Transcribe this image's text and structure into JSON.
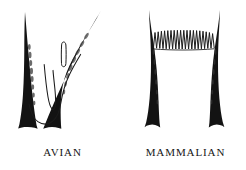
{
  "figure": {
    "background_color": "#ffffff",
    "ink_color": "#111111",
    "width": 246,
    "height": 170,
    "caption_font_style": "serif-small-caps-allcaps"
  },
  "panels": [
    {
      "id": "avian",
      "label": "AVIAN",
      "description": "Ink brush drawing of two tapered wedge strokes flanking a thin sagging line with a narrow central V hook and a small detached sliver oval",
      "strokes": [
        {
          "name": "left-wedge",
          "type": "tapered-wedge",
          "thin_end": "top",
          "thick_end": "bottom"
        },
        {
          "name": "right-wedge",
          "type": "tapered-wedge-curved",
          "thin_end": "top",
          "thick_end": "bottom"
        },
        {
          "name": "sagging-connector",
          "type": "thin-curve"
        },
        {
          "name": "central-v-hook",
          "type": "thin-v-hook"
        },
        {
          "name": "sliver-oval",
          "type": "small-outline-oval"
        }
      ]
    },
    {
      "id": "mammalian",
      "label": "MAMMALIAN",
      "description": "Ink brush drawing of two tapered columns flaring at the base joined at the top by a dense accordion zigzag band",
      "zigzag_peak_count": 19,
      "strokes": [
        {
          "name": "left-column",
          "type": "tapered-column",
          "thin_end": "top",
          "thick_end": "bottom",
          "base": "flared"
        },
        {
          "name": "right-column",
          "type": "tapered-column",
          "thin_end": "top",
          "thick_end": "bottom",
          "base": "flared"
        },
        {
          "name": "accordion-zigzag",
          "type": "dense-zigzag-band"
        }
      ]
    }
  ]
}
